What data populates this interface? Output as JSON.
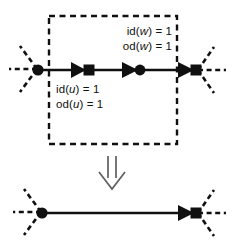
{
  "figure": {
    "colors": {
      "ink": "#101010",
      "background": "#ffffff",
      "arrow_outline": "#6b6b6b"
    },
    "labels": {
      "w_indegree": "id(w) = 1",
      "w_outdegree": "od(w) = 1",
      "u_indegree": "id(u) = 1",
      "u_outdegree": "od(u) = 1"
    },
    "label_parts": {
      "w_indegree": {
        "prefix": "id(",
        "var": "w",
        "suffix": ") = 1"
      },
      "w_outdegree": {
        "prefix": "od(",
        "var": "w",
        "suffix": ") = 1"
      },
      "u_indegree": {
        "prefix": "id(",
        "var": "u",
        "suffix": ") = 1"
      },
      "u_outdegree": {
        "prefix": "od(",
        "var": "u",
        "suffix": ") = 1"
      }
    },
    "top_panel": {
      "selection_box": "dashed-rectangle",
      "nodes": [
        {
          "id": "left-endpoint",
          "shape": "filled-circle",
          "x": 38,
          "y": 70,
          "rays": 3
        },
        {
          "id": "node-u",
          "shape": "filled-square",
          "x": 88,
          "y": 70,
          "rays": 0
        },
        {
          "id": "node-w",
          "shape": "filled-circle",
          "x": 140,
          "y": 70,
          "rays": 0
        },
        {
          "id": "right-endpoint",
          "shape": "filled-square",
          "x": 196,
          "y": 70,
          "rays": 3
        }
      ],
      "edges": [
        {
          "from": "left-endpoint",
          "to": "node-u",
          "arrow": true
        },
        {
          "from": "node-u",
          "to": "node-w",
          "arrow": true
        },
        {
          "from": "node-w",
          "to": "right-endpoint",
          "arrow": true
        }
      ]
    },
    "transform_arrow": {
      "glyph": "double-down-arrow",
      "direction": "down"
    },
    "bottom_panel": {
      "nodes": [
        {
          "id": "left-endpoint",
          "shape": "filled-circle",
          "x": 42,
          "y": 213,
          "rays": 3
        },
        {
          "id": "right-endpoint",
          "shape": "filled-square",
          "x": 196,
          "y": 213,
          "rays": 3
        }
      ],
      "edges": [
        {
          "from": "left-endpoint",
          "to": "right-endpoint",
          "arrow": true
        }
      ]
    }
  }
}
